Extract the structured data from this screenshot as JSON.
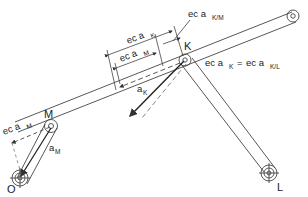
{
  "diagram": {
    "type": "linkage-mechanism",
    "colors": {
      "line": "#333333",
      "background": "#ffffff"
    },
    "points": {
      "O": {
        "label": "O"
      },
      "M": {
        "label": "M"
      },
      "K": {
        "label": "K"
      },
      "L": {
        "label": "L"
      }
    },
    "labels": {
      "ec_aK_top": {
        "prefix": "ec a",
        "sub": "K"
      },
      "ec_aKM": {
        "prefix": "ec a",
        "sub": "K/M"
      },
      "ec_aM_top": {
        "prefix": "ec a",
        "sub": "M"
      },
      "aK": {
        "prefix": "a",
        "sub": "K"
      },
      "ec_aK_eq_left": {
        "prefix": "ec a",
        "sub": "K"
      },
      "equals": "=",
      "ec_aKL": {
        "prefix": "ec a",
        "sub": "K/L"
      },
      "ec_aM_left": {
        "prefix": "ec a",
        "sub": "M"
      },
      "aM": {
        "prefix": "a",
        "sub": "M"
      }
    }
  }
}
